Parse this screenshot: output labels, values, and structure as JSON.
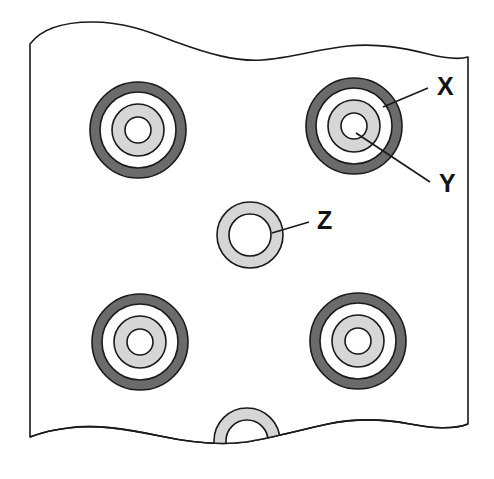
{
  "figure": {
    "background_color": "#ffffff",
    "outline_color": "#1a1a1a",
    "plate_fill": "#ffffff"
  },
  "colors": {
    "outer_ring": "#6b6b6b",
    "mid_gap": "#ffffff",
    "inner_ring": "#d6d6d6",
    "bore": "#ffffff",
    "stroke": "#1a1a1a",
    "label_text": "#131313",
    "leader_line": "#1a1a1a"
  },
  "labels": [
    {
      "id": "x",
      "text": "X",
      "x": 437,
      "y": 88,
      "target": "outer-ring-of-top-right-hole"
    },
    {
      "id": "y",
      "text": "Y",
      "x": 439,
      "y": 185,
      "target": "inner-ring-of-top-right-hole"
    },
    {
      "id": "z",
      "text": "Z",
      "x": 317,
      "y": 222,
      "target": "center-washer-ring"
    }
  ],
  "leaders": [
    {
      "id": "x",
      "x1": 428,
      "y1": 88,
      "x2": 383,
      "y2": 107
    },
    {
      "id": "y",
      "x1": 430,
      "y1": 182,
      "x2": 356,
      "y2": 133
    },
    {
      "id": "z",
      "x1": 309,
      "y1": 222,
      "x2": 272,
      "y2": 233
    }
  ],
  "holes": {
    "counterbored": [
      {
        "id": "top-left",
        "cx": 138,
        "cy": 130,
        "r_outer": 48,
        "r_gap": 38,
        "r_inner": 26,
        "r_bore": 13
      },
      {
        "id": "top-right",
        "cx": 354,
        "cy": 126,
        "r_outer": 48,
        "r_gap": 38,
        "r_inner": 26,
        "r_bore": 13
      },
      {
        "id": "bottom-left",
        "cx": 140,
        "cy": 342,
        "r_outer": 48,
        "r_gap": 38,
        "r_inner": 26,
        "r_bore": 13
      },
      {
        "id": "bottom-right",
        "cx": 358,
        "cy": 341,
        "r_outer": 48,
        "r_gap": 38,
        "r_inner": 26,
        "r_bore": 13
      }
    ],
    "plain_washer": [
      {
        "id": "center",
        "cx": 250,
        "cy": 235,
        "r_outer": 33,
        "r_bore": 21,
        "clipped": false
      },
      {
        "id": "bottom-edge",
        "cx": 247,
        "cy": 441,
        "r_outer": 33,
        "r_bore": 21,
        "clipped": true
      }
    ]
  },
  "counts": {
    "counterbored_holes": 4,
    "plain_washer_rings": 2,
    "callouts": 3
  }
}
